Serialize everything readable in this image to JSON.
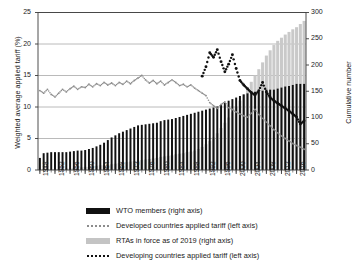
{
  "chart_data": {
    "type": "bar",
    "title": "",
    "subtitle": "",
    "xlabel": "",
    "ylabel": "Weighted average applied tariff (%)",
    "ylabel_right": "Cumulative number",
    "ylim": [
      0,
      25
    ],
    "ylim_right": [
      0,
      300
    ],
    "yticks": [
      "0",
      "5",
      "10",
      "15",
      "20",
      "25"
    ],
    "yticks_right": [
      "0",
      "50",
      "100",
      "150",
      "200",
      "250",
      "300"
    ],
    "grid": true,
    "legend_position": "below",
    "x": [
      1948,
      1949,
      1950,
      1951,
      1952,
      1953,
      1954,
      1955,
      1956,
      1957,
      1958,
      1959,
      1960,
      1961,
      1962,
      1963,
      1964,
      1965,
      1966,
      1967,
      1968,
      1969,
      1970,
      1971,
      1972,
      1973,
      1974,
      1975,
      1976,
      1977,
      1978,
      1979,
      1980,
      1981,
      1982,
      1983,
      1984,
      1985,
      1986,
      1987,
      1988,
      1989,
      1990,
      1991,
      1992,
      1993,
      1994,
      1995,
      1996,
      1997,
      1998,
      1999,
      2000,
      2001,
      2002,
      2003,
      2004,
      2005,
      2006,
      2007,
      2008,
      2009,
      2010,
      2011,
      2012,
      2013,
      2014,
      2015,
      2016,
      2017,
      2018
    ],
    "xtick_labels": [
      "1948",
      "1952",
      "1956",
      "1960",
      "1964",
      "1968",
      "1972",
      "1976",
      "1980",
      "1984",
      "1988",
      "1992",
      "1996",
      "2000",
      "2004",
      "2008",
      "2012",
      "2016"
    ],
    "series": [
      {
        "name": "WTO members (right axis)",
        "type": "bar",
        "axis": "right",
        "color": "#111111",
        "values": [
          23,
          32,
          33,
          34,
          34,
          34,
          34,
          34,
          35,
          36,
          37,
          37,
          38,
          40,
          42,
          45,
          48,
          52,
          57,
          62,
          66,
          70,
          73,
          76,
          79,
          82,
          85,
          86,
          87,
          88,
          89,
          90,
          93,
          95,
          96,
          97,
          99,
          101,
          103,
          105,
          107,
          109,
          111,
          113,
          115,
          117,
          119,
          121,
          124,
          128,
          132,
          135,
          138,
          141,
          144,
          146,
          148,
          149,
          150,
          151,
          153,
          153,
          153,
          155,
          157,
          159,
          160,
          162,
          164,
          164,
          164
        ]
      },
      {
        "name": "RTAs in force as of 2019 (right axis)",
        "type": "bar",
        "axis": "right",
        "color": "#c9c9c9",
        "values": [
          1,
          1,
          1,
          1,
          2,
          2,
          2,
          3,
          3,
          4,
          4,
          5,
          6,
          6,
          7,
          8,
          9,
          9,
          10,
          11,
          12,
          13,
          14,
          15,
          16,
          17,
          18,
          19,
          20,
          21,
          22,
          23,
          25,
          26,
          27,
          28,
          30,
          31,
          32,
          34,
          35,
          37,
          40,
          44,
          49,
          55,
          62,
          70,
          80,
          90,
          100,
          110,
          120,
          132,
          144,
          156,
          168,
          180,
          192,
          205,
          218,
          228,
          238,
          246,
          252,
          258,
          263,
          268,
          272,
          278,
          284
        ]
      },
      {
        "name": "Developed countries applied tariff (left axis)",
        "type": "line",
        "style": "dotted-light",
        "axis": "left",
        "color": "#8c8c8c",
        "values": [
          12.6,
          12.2,
          12.8,
          12.0,
          11.6,
          12.2,
          12.8,
          12.4,
          12.9,
          13.3,
          12.8,
          13.2,
          13.1,
          13.6,
          13.2,
          13.7,
          13.4,
          13.9,
          13.5,
          13.8,
          13.4,
          13.9,
          13.6,
          14.1,
          13.7,
          14.2,
          14.6,
          15.0,
          14.3,
          13.8,
          14.2,
          13.7,
          14.1,
          13.5,
          13.9,
          14.3,
          13.9,
          13.4,
          13.6,
          13.2,
          13.5,
          13.0,
          12.6,
          12.2,
          11.8,
          10.7,
          10.2,
          9.8,
          10.4,
          10.8,
          9.9,
          9.6,
          9.2,
          8.9,
          8.6,
          8.4,
          9.0,
          9.6,
          8.8,
          8.2,
          7.6,
          7.0,
          6.4,
          5.9,
          5.4,
          5.0,
          4.6,
          4.2,
          3.9,
          3.6,
          3.3
        ]
      },
      {
        "name": "Developing countries applied tariff  (left axis)",
        "type": "line",
        "style": "dotted-dark",
        "axis": "left",
        "start_year": 1991,
        "color": "#111111",
        "values": [
          null,
          null,
          null,
          null,
          null,
          null,
          null,
          null,
          null,
          null,
          null,
          null,
          null,
          null,
          null,
          null,
          null,
          null,
          null,
          null,
          null,
          null,
          null,
          null,
          null,
          null,
          null,
          null,
          null,
          null,
          null,
          null,
          null,
          null,
          null,
          null,
          null,
          null,
          null,
          null,
          null,
          null,
          null,
          14.9,
          16.4,
          18.6,
          17.9,
          19.1,
          17.2,
          15.6,
          16.8,
          18.3,
          16.1,
          14.2,
          13.5,
          12.9,
          12.3,
          11.9,
          12.6,
          13.9,
          12.4,
          11.5,
          11.0,
          10.6,
          10.2,
          9.8,
          9.4,
          8.9,
          8.4,
          7.3,
          7.8
        ]
      }
    ],
    "legend": [
      {
        "label": "WTO members (right axis)",
        "key": "black-bar"
      },
      {
        "label": "Developed countries applied tariff (left axis)",
        "key": "dotted-light"
      },
      {
        "label": "RTAs in force as of 2019 (right axis)",
        "key": "gray-bar"
      },
      {
        "label": "Developing countries applied tariff  (left axis)",
        "key": "dotted-dark"
      }
    ]
  }
}
